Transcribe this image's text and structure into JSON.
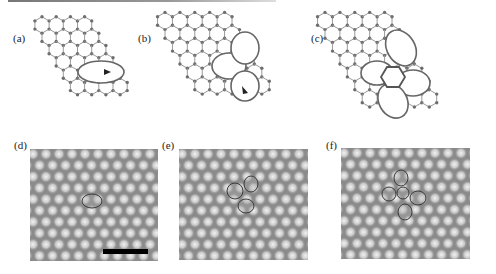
{
  "figure": {
    "panels": [
      {
        "id": "a",
        "label": "(a)",
        "type": "atomic-model",
        "description": "Graphene lattice with 5-8-5 divacancy defect, arrow marking bond"
      },
      {
        "id": "b",
        "label": "(b)",
        "type": "atomic-model",
        "description": "Graphene lattice with 555-777 reconstructed divacancy, arrow marking bond rotation"
      },
      {
        "id": "c",
        "label": "(c)",
        "type": "atomic-model",
        "description": "Graphene lattice with 5555-6-7777 reconstructed divacancy"
      },
      {
        "id": "d",
        "label": "(d)",
        "type": "simulated-image",
        "description": "Image with single elongated outlined defect",
        "scale_bar": true
      },
      {
        "id": "e",
        "label": "(e)",
        "type": "simulated-image",
        "description": "Image with three-lobe outlined defect"
      },
      {
        "id": "f",
        "label": "(f)",
        "type": "simulated-image",
        "description": "Image with four-lobe cross-shaped outlined defect"
      }
    ],
    "colors": {
      "atom": "#6e6e6e",
      "bond": "#9a9a9a",
      "image_bg": "#8a8a8a",
      "bright_spot": "#f2f2f2",
      "outline": "#3a3a3a",
      "scale_bar": "#000000"
    }
  }
}
